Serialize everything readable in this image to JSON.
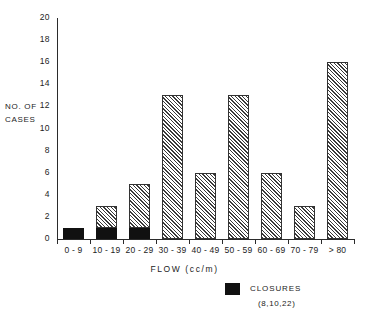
{
  "chart_data": {
    "type": "bar",
    "title": "",
    "xlabel": "FLOW (cc/m)",
    "ylabel": "NO. OF CASES",
    "ylabel_lines": [
      "NO. OF",
      "CASES"
    ],
    "categories": [
      "0 - 9",
      "10 - 19",
      "20 - 29",
      "30 - 39",
      "40 - 49",
      "50 - 59",
      "60 - 69",
      "70 - 79",
      "> 80"
    ],
    "values": [
      1,
      3,
      5,
      13,
      6,
      13,
      6,
      3,
      16
    ],
    "series": [
      {
        "name": "CLOSURES",
        "fill": "solid-black",
        "values": [
          1,
          1,
          1,
          0,
          0,
          0,
          0,
          0,
          0
        ]
      },
      {
        "name": "CASES",
        "fill": "diagonal-hatch",
        "values": [
          0,
          2,
          4,
          13,
          6,
          13,
          6,
          3,
          16
        ]
      }
    ],
    "ylim": [
      0,
      20
    ],
    "ytick_step": 2,
    "yticks": [
      0,
      2,
      4,
      6,
      8,
      10,
      12,
      14,
      16,
      18,
      20
    ],
    "ytick_labels": [
      "0",
      "2",
      "4",
      "6",
      "8",
      "10",
      "12",
      "14",
      "16",
      "18",
      "20"
    ],
    "grid": false,
    "legend": {
      "position": "bottom-right",
      "entries": [
        {
          "label": "CLOSURES",
          "sublabel": "(8,10,22)",
          "swatch": "solid-black",
          "color": "#111111"
        }
      ]
    },
    "colors": {
      "axis": "#2b2b2b",
      "hatch": "#3a3a3a",
      "solid": "#111111",
      "background": "#ffffff"
    }
  }
}
